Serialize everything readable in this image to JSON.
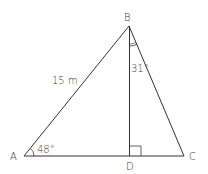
{
  "diagram": {
    "type": "triangle",
    "vertices": {
      "A": {
        "label": "A"
      },
      "B": {
        "label": "B"
      },
      "C": {
        "label": "C"
      },
      "D": {
        "label": "D"
      }
    },
    "measurements": {
      "side_AB": "15 m",
      "angle_A": "48°",
      "angle_DBC": "31°"
    },
    "marks": {
      "right_angle_at": "D",
      "angle_arc_at": [
        "A",
        "B"
      ]
    },
    "colors": {
      "stroke": "#333333",
      "text": "#3a3a3a",
      "background": "#ffffff"
    }
  }
}
